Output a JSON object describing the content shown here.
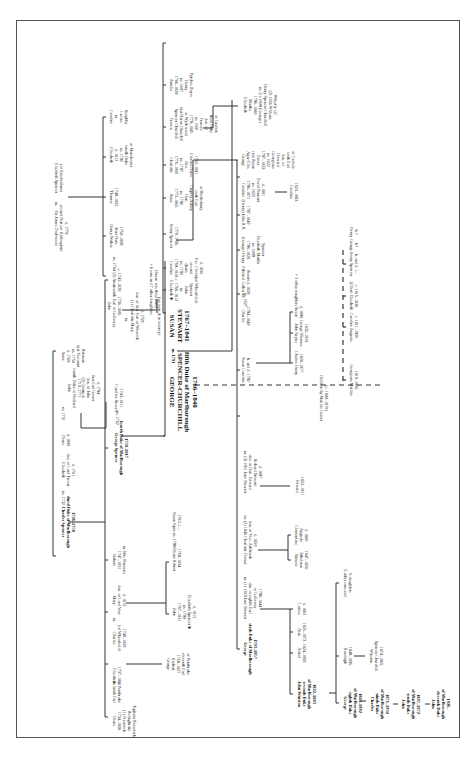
{
  "diagram": {
    "orientation": "rotated 90 degrees",
    "nodes": {
      "charles_3rd_duke": [
        "Charles Spencer",
        "third Duke of Marlborough",
        "1706–1758"
      ],
      "m_1732": "m. 1732",
      "elizabeth_trevor": [
        "Elizabeth",
        "dau. of Lord Trevor",
        "d. 1761"
      ],
      "diana": [
        "Diana",
        "d. 1808"
      ],
      "m_1751": "m. 1751",
      "john_4th_bedford": [
        "John",
        "fourth Duke of Bedford",
        "1710–1771"
      ],
      "gertrude": [
        "(2) Gertrude",
        "dau. of John",
        "first Earl Gower",
        "d. 1794"
      ],
      "anne": [
        "Anne",
        "d. 1769",
        "m. 1750",
        "first Viscount",
        "Bateman"
      ],
      "george_4th_duke": [
        "George Spencer",
        "fourth Duke of Marlborough",
        "1739–1817"
      ],
      "m_1762": "m. 1762",
      "caroline_russell": [
        "Caroline Russell",
        "1743–1811"
      ],
      "robert": [
        "Robert",
        "1747–1831",
        "m. Mrs Bouverie"
      ],
      "mary": [
        "Mary",
        "dau. of Lord Vere",
        "d. 1812"
      ],
      "charles_wheatfield": [
        "Charles",
        "(of Wheatfield)",
        "1740–1820"
      ],
      "m_charles": "m.",
      "elizabeth_pembroke": [
        "Elizabeth",
        "1737–1831"
      ],
      "m_pembroke": [
        "m. tenth Earl",
        "of Pembroke"
      ],
      "diana_beauclerk": [
        "Diana",
        "1734–1808",
        "(1) Frederick",
        "Bolingbroke",
        "Topham Beauclerk"
      ],
      "william_robert": [
        "William Robert",
        "1769–1834"
      ],
      "m_1791": "m. 1791",
      "susan_spen": [
        "Susan Spen",
        "1783–1..."
      ],
      "john_wheatfield": [
        "John",
        "1767–1831",
        "m. 1790",
        "Elizabeth Spencer ✱",
        "d. 1812"
      ],
      "george_herbert": [
        "George",
        "Herbert",
        "1759–1827",
        "eleventh Earl",
        "of Pembroke"
      ],
      "sir_james_dashwood": [
        "Sir James Dashwood",
        "second Bart (of Kirtlington)",
        "d. 1779"
      ],
      "m_dashwood": "m.",
      "elizabeth_spencer_rendlesham": [
        "Elizabeth Spencer",
        "(of Rendlesham)"
      ],
      "caroline_knightly": [
        "Caroline",
        "m.",
        "Lucius",
        "Knightly"
      ],
      "elizabeth_d1812": [
        "Elizabeth",
        "d. 1812",
        "m. 1792",
        "fourth Duke",
        "of Manchester"
      ],
      "thomas": [
        "Thomas",
        "1749–1825"
      ],
      "henry_watkin": [
        "Henry Watkin",
        "third Bart.",
        "1750–1809"
      ],
      "m_1764": "m. 1764",
      "anne_dashwood": [
        "(2) Anne",
        "c. 1743–1830"
      ],
      "john_galloway": [
        "John",
        "seventh Earl of Galloway",
        "1736–1806"
      ],
      "galloway_m": "m.",
      "charlotte_mary": [
        "(1) Charlotte Mary",
        "dau. of first Earl of Warwick",
        "d. 1759"
      ],
      "see_note": "(see note 4: in infancy)",
      "eight_sons": [
        "+ 8 sons and 7 other daughters",
        "(Susan was third born)"
      ],
      "george_5th_duke": [
        "GEORGE",
        "SPENCER-CHURCHILL",
        "fifth Duke of Marlborough",
        "1766–1840"
      ],
      "m_1791_main": "m. 1791",
      "susan_stewart": [
        "SUSAN",
        "STEWART",
        "1767–1841"
      ],
      "elizabeth_wheatfield": [
        "Elizabeth ✱",
        "c. 1768–1812",
        "m.",
        "John",
        "Spencer",
        "(of Wheatfield)"
      ],
      "caroline_m1792": [
        "Caroline",
        "1769–1818",
        "m. 1792",
        "(born",
        "second",
        "Vsc. Clifden",
        "d. 1836"
      ],
      "henry_spencer": [
        "Henry Spencer",
        "1770–1795"
      ],
      "anne_shaftesbury": [
        "Anne",
        "1773–1865",
        "m. 1796",
        "Hon.",
        "Cropley Ashley",
        "sixth Earl",
        "of Shaftesbury"
      ],
      "charlotte": [
        "Charlotte",
        "1776–1802",
        "m. 1797",
        "Rev.",
        "Edward Nares",
        "1762–1841"
      ],
      "francis_wychwood": [
        "Francis",
        "Spencer Churchill",
        "first Baron Churchill",
        "of Wychwood",
        "1779–1845",
        "m. 1801",
        "Frances",
        "dau. of",
        "third Duke",
        "of Grafton"
      ],
      "amelia": [
        "Amelia",
        "1786–1829",
        "m. 1807",
        "Henry",
        "Pytches Boyce"
      ],
      "elizabeth_martha": [
        "Elizabeth",
        "Martha",
        "1796–1880",
        "m. (1) 1809 (George)",
        "Henry Spencer-Churchill",
        "(2) 1856 William",
        "Wheatly QC"
      ],
      "george_agar_ellis": [
        "George",
        "Agar-Ellis",
        "first Baron",
        "Dover",
        "1797–1833",
        "m. 1822",
        "Georgiana",
        "Howard",
        "dau. of",
        "sixth Earl",
        "of Carlisle"
      ],
      "caroline_pennant": [
        "Caroline",
        "1796–1871",
        "m. 1822",
        "David Pennant",
        "d. 1881"
      ],
      "caroline_1823": [
        "Caroline",
        "1823–1883"
      ],
      "henry_john": [
        "(Henry) John R.N.",
        "1797–1840"
      ],
      "george_henry": [
        "(George) Henry",
        "1796–1828",
        "m. 1809",
        "Elizabeth Martha",
        "Spencer"
      ],
      "charles_1794": [
        "Charles",
        "1794–1840"
      ],
      "m_1827": "m. 1827",
      "ethelred_catherine": [
        "Ethelred Catherine",
        "Benett d. 1839"
      ],
      "charles_henry": [
        "Charles Henry",
        "1828–1877"
      ],
      "john_kryna": [
        "John Kryna",
        "George Thomas",
        "1835–1918"
      ],
      "susan_d1898": [
        "Susan",
        "d. 1898"
      ],
      "two_daughters": "+ 2 other daughters",
      "susan_caroline": [
        "Susan Caroline",
        "b. and d. 1792"
      ],
      "children_matilda": [
        "Children by Matilda Glover",
        "(c. 1800–1870)"
      ],
      "georgiana_matilda": [
        "Georgiana Matilda",
        "1810–1866"
      ],
      "caroline_augusta": [
        "Caroline Augusta",
        "c. 1811–1905"
      ],
      "ellen_elizabeth": [
        "(Ellen) Elizabeth",
        "c. 1815–1838"
      ],
      "henry_spencer_b": [
        "Henry Spencer",
        "b. and d. 1..."
      ],
      "george_b": [
        "George",
        "b?"
      ],
      "henry_b": [
        "Henry",
        "b.?"
      ],
      "george_6th_duke": [
        "George",
        "sixth Duke of Marlborough",
        "1793–1857"
      ],
      "m1_jane": [
        "m. (1) 1819 Jane Stewart",
        "dau. of eighth Earl",
        "of Galloway",
        "1798–1844"
      ],
      "m2_charlotte": [
        "m. (2) 1846 Charlotte Flower",
        "dau. of Visc. Ashbrook",
        "d. 1850"
      ],
      "m3_jane": [
        "m. (3) 1851 Jane Stewart",
        "dau. of Hon. Edward",
        "Richard Stewart",
        "d. 1897"
      ],
      "edward": [
        "Edward",
        "1853–1911"
      ],
      "almeric": [
        "Almeric",
        "Athelstan",
        "1847–1856"
      ],
      "clementina": [
        "Clementina",
        "Augusta",
        "d. 1886"
      ],
      "john_winston": [
        "John Winston",
        "seventh Duke",
        "of Marlborough",
        "1822–1883"
      ],
      "alfred": [
        "Alfred",
        "1824–1893"
      ],
      "alan": [
        "Alan",
        "1825–1873"
      ],
      "louisa": [
        "Louisa",
        "d. 1882"
      ],
      "five_sons": [
        "5 other sons and",
        "6 daughters"
      ],
      "randolph": [
        "Randolph",
        "1849–1895"
      ],
      "winston": [
        "Winston",
        "Spencer Churchill",
        "1874–1965"
      ],
      "george_8th": [
        "George",
        "eighth Duke",
        "of Marlborough",
        "1844–1892"
      ],
      "charles_9th": [
        "Charles",
        "ninth Duke",
        "of Marlborough",
        "1871–1934"
      ],
      "john_10th": [
        "John",
        "tenth Duke",
        "of Marlborough",
        "1897–1972"
      ],
      "john_11th": [
        "John",
        "eleventh Duke",
        "of Marlborough",
        "1926–"
      ]
    }
  }
}
